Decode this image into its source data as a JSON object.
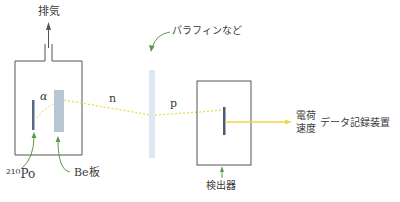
{
  "diagram": {
    "labels": {
      "exhaust": "排気",
      "alpha": "α",
      "neutron": "n",
      "proton": "p",
      "paraffin": "パラフィンなど",
      "polonium": "²¹⁰Po",
      "beryllium": "Be板",
      "detector": "検出器",
      "charge": "電荷",
      "velocity": "速度",
      "recorder": "データ記録装置"
    },
    "colors": {
      "box_stroke": "#555555",
      "arrow_green": "#5a9a4a",
      "beam_yellow": "#e8d84a",
      "be_plate": "#b8c6d4",
      "paraffin": "#dde8f2",
      "po_source": "#5a6a80",
      "detector_bar": "#4a5a78"
    }
  }
}
